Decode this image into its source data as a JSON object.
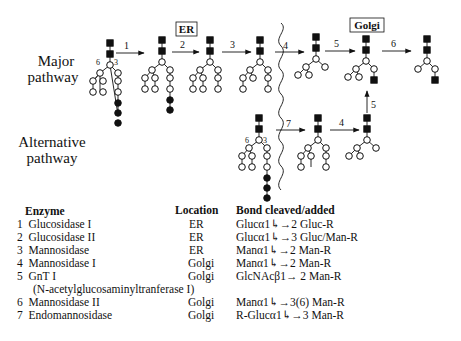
{
  "diagram": {
    "row_labels": {
      "major": [
        "Major",
        "pathway"
      ],
      "alternative": [
        "Alternative",
        "pathway"
      ]
    },
    "compartments": {
      "er": "ER",
      "golgi": "Golgi"
    },
    "branch_labels": {
      "left": "6",
      "right": "3"
    },
    "major_steps": [
      "1",
      "2",
      "3",
      "4",
      "5",
      "6"
    ],
    "alternative_steps": [
      "7",
      "4",
      "5"
    ]
  },
  "table": {
    "headers": {
      "enzyme": "Enzyme",
      "location": "Location",
      "bond": "Bond cleaved/added"
    },
    "rows": [
      {
        "num": "1",
        "enzyme": "Glucosidase I",
        "location": "ER",
        "bond_left": "Glucα1",
        "bond_right": "2 Gluc-R"
      },
      {
        "num": "2",
        "enzyme": "Glucosidase II",
        "location": "ER",
        "bond_left": "Glucα1",
        "bond_right": "3 Gluc/Man-R"
      },
      {
        "num": "3",
        "enzyme": "Mannosidase",
        "location": "ER",
        "bond_left": "Manα1",
        "bond_right": "2 Man-R"
      },
      {
        "num": "4",
        "enzyme": "Mannosidase I",
        "location": "Golgi",
        "bond_left": "Manα1",
        "bond_right": "2 Man-R"
      },
      {
        "num": "5",
        "enzyme": "GnT I",
        "location": "Golgi",
        "bond_left": "GlcNAcβ1",
        "bond_right": "2 Man-R"
      },
      {
        "num": "",
        "enzyme": "(N-acetylglucosaminyltranferase I)",
        "location": "",
        "bond_left": "",
        "bond_right": ""
      },
      {
        "num": "6",
        "enzyme": "Mannosidase II",
        "location": "Golgi",
        "bond_left": "Manα1",
        "bond_right": "3(6) Man-R"
      },
      {
        "num": "7",
        "enzyme": "Endomannosidase",
        "location": "Golgi",
        "bond_left": "R-Glucα1",
        "bond_right": "3 Man-R"
      }
    ]
  },
  "legend_symbols": {
    "filled_square": "GlcNAc",
    "open_circle": "Mannose",
    "filled_circle": "Glucose"
  }
}
